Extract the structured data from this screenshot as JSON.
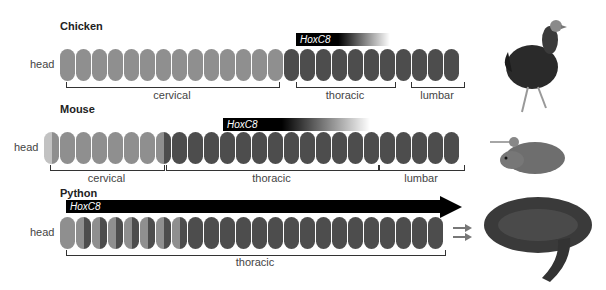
{
  "rows": [
    {
      "title": "Chicken",
      "head": "head",
      "hox": "HoxC8",
      "segments": [
        {
          "label": "cervical",
          "count": 14
        },
        {
          "label": "thoracic",
          "count": 7
        },
        {
          "label": "lumbar",
          "count": 4
        }
      ]
    },
    {
      "title": "Mouse",
      "head": "head",
      "hox": "HoxC8",
      "segments": [
        {
          "label": "cervical",
          "count": 7
        },
        {
          "label": "thoracic",
          "count": 13
        },
        {
          "label": "lumbar",
          "count": 6
        }
      ]
    },
    {
      "title": "Python",
      "head": "head",
      "hox": "HoxC8",
      "segments": [
        {
          "label": "thoracic",
          "count": 24
        }
      ]
    }
  ],
  "animals": [
    "chicken-image",
    "mouse-image",
    "python-image"
  ]
}
